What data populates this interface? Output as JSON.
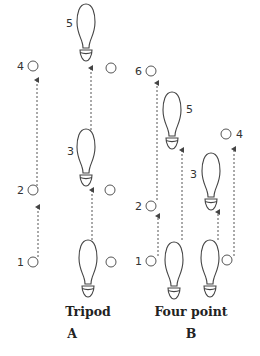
{
  "figure": {
    "panels": [
      {
        "id": "A",
        "title": "Tripod",
        "letter": "A",
        "step_labels": [
          "1",
          "2",
          "3",
          "4",
          "5"
        ]
      },
      {
        "id": "B",
        "title": "Four point",
        "letter": "B",
        "step_labels": [
          "1",
          "2",
          "3",
          "4",
          "5",
          "6"
        ]
      }
    ],
    "icons": {
      "foot": "footprint-icon",
      "crutch_tip": "circle-icon",
      "movement": "dashed-arrow-icon"
    },
    "colors": {
      "line": "#555555",
      "text": "#222222",
      "background": "#ffffff"
    }
  }
}
